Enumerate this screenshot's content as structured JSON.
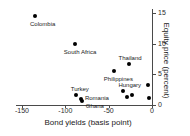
{
  "chart_data": {
    "type": "scatter",
    "title": "",
    "xlabel": "Bond yields (basis point)",
    "ylabel": "Equity price (percent)",
    "xlim": [
      -165,
      5
    ],
    "ylim": [
      0,
      15.8
    ],
    "xticks": [
      -150,
      -100,
      -50,
      0
    ],
    "xtick_labels": [
      "-150",
      "-100",
      "-50",
      "0"
    ],
    "yticks": [
      0,
      5,
      10,
      15
    ],
    "ytick_labels": [
      "0",
      "5",
      "10",
      "15"
    ],
    "yaxis_position": "right",
    "grid": false,
    "legend": false,
    "marker": "filled-circle",
    "marker_color": "#000000",
    "points": [
      {
        "label": "Colombia",
        "x": -135,
        "y": 14.5,
        "label_dx": -5,
        "label_dy": 5
      },
      {
        "label": "South Africa",
        "x": -89,
        "y": 9.9,
        "label_dx": -11,
        "label_dy": 5
      },
      {
        "label": "Thailand",
        "x": -27,
        "y": 6.7,
        "label_dx": -10,
        "label_dy": -9
      },
      {
        "label": "Philippines",
        "x": -44,
        "y": 5.5,
        "label_dx": -10,
        "label_dy": 5
      },
      {
        "label": "Hungary",
        "x": -33,
        "y": 2.3,
        "label_dx": -5,
        "label_dy": -9
      },
      {
        "label": "Turkey",
        "x": -88,
        "y": 1.6,
        "label_dx": -5,
        "label_dy": -9
      },
      {
        "label": "Romania",
        "x": -82,
        "y": 1.0,
        "label_dx": 4,
        "label_dy": -4
      },
      {
        "label": "Ghana",
        "x": -81,
        "y": 0.7,
        "label_dx": 4,
        "label_dy": 2
      },
      {
        "label": "",
        "x": -29,
        "y": 1.3,
        "label_dx": 0,
        "label_dy": 0
      },
      {
        "label": "",
        "x": -23,
        "y": 1.6,
        "label_dx": 0,
        "label_dy": 0
      },
      {
        "label": "",
        "x": -5,
        "y": 3.2,
        "label_dx": 0,
        "label_dy": 0
      },
      {
        "label": "",
        "x": -4,
        "y": 1.1,
        "label_dx": 0,
        "label_dy": 0
      }
    ]
  }
}
